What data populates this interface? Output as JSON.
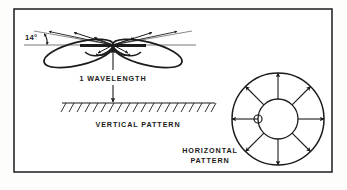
{
  "figure": {
    "kind": "antenna-radiation-pattern-diagram",
    "background_color": "#fdfdfc",
    "ink_color": "#1b1b1b",
    "frame": {
      "name": "figure-border",
      "x": 14,
      "y": 9,
      "width": 318,
      "height": 163,
      "stroke_color": "#2a2a2a",
      "stroke_width": 1.6
    },
    "labels": {
      "elevation_angle": "14°",
      "height_dimension": "1 WAVELENGTH",
      "vertical_pattern": "VERTICAL PATTERN",
      "horizontal_pattern_line1": "HORIZONTAL",
      "horizontal_pattern_line2": "PATTERN"
    },
    "vertical_pattern": {
      "name": "vertical-pattern-diagram",
      "antenna_center_x": 113,
      "antenna_center_y": 45,
      "antenna_bar_half_width": 33,
      "main_lobe_tilt_degrees": 14,
      "main_lobe_count": 2,
      "minor_lobe_count": 4,
      "ground_line_y": 103,
      "ground_line_x_start": 62,
      "ground_line_x_end": 215,
      "ground_hatch_count": 20,
      "dimension_arrow_top_y": 50,
      "dimension_arrow_bottom_y": 102
    },
    "horizontal_pattern": {
      "name": "horizontal-pattern-diagram",
      "center_x": 278,
      "center_y": 119,
      "outer_radius": 46,
      "inner_radius": 20,
      "element_circle_radius": 4,
      "element_circle_offset_x": -20,
      "arrow_count": 8,
      "arrow_angles_degrees": [
        0,
        45,
        90,
        135,
        180,
        225,
        270,
        315
      ]
    }
  }
}
